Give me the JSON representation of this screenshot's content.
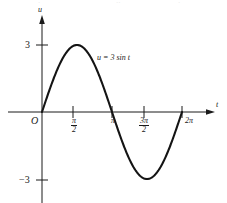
{
  "figure": {
    "background_color": "#ffffff",
    "ink_color": "#1a1a1a",
    "width": 227,
    "height": 203
  },
  "axes": {
    "u_axis_label": "u",
    "t_axis_label": "t",
    "origin_label": "O"
  },
  "ticks": {
    "y": [
      {
        "label": "3",
        "value": 3
      },
      {
        "label": "−3",
        "value": -3
      }
    ],
    "x": [
      {
        "label_num": "π",
        "label_den": "2",
        "kind": "fraction",
        "value": 1.5708
      },
      {
        "label": "π",
        "kind": "plain",
        "value": 3.1416
      },
      {
        "label_num": "3π",
        "label_den": "2",
        "kind": "fraction",
        "value": 4.7124
      },
      {
        "label": "2π",
        "kind": "plain",
        "value": 6.2832
      }
    ]
  },
  "curve": {
    "equation_label": "u = 3 sin t",
    "amplitude": 3,
    "color": "#141414"
  },
  "scan_artifact": {
    "fragments": [
      "·",
      "··",
      "·"
    ]
  },
  "chart_data": {
    "type": "line",
    "title": "",
    "subtitle": "",
    "xlabel": "t",
    "ylabel": "u",
    "grid": false,
    "legend": "none",
    "annotations": [
      {
        "text": "u = 3 sin t",
        "x": 2.6,
        "y": 1.95
      },
      {
        "text": "O",
        "x": 0,
        "y": 0
      }
    ],
    "xlim": [
      -0.55,
      7.35
    ],
    "ylim": [
      -4.35,
      4.6
    ],
    "xticks": [
      1.5708,
      3.1416,
      4.7124,
      6.2832
    ],
    "xticklabels": [
      "π/2",
      "π",
      "3π/2",
      "2π"
    ],
    "yticks": [
      3,
      -3
    ],
    "yticklabels": [
      "3",
      "−3"
    ],
    "series": [
      {
        "name": "u = 3 sin t",
        "formula": "u = 3*sin(t)",
        "x": [
          0,
          0.3142,
          0.6283,
          0.9425,
          1.2566,
          1.5708,
          1.885,
          2.1991,
          2.5133,
          2.8274,
          3.1416,
          3.4558,
          3.7699,
          4.0841,
          4.3982,
          4.7124,
          5.0265,
          5.3407,
          5.6549,
          5.969,
          6.2832
        ],
        "values": [
          0,
          0.927,
          1.763,
          2.427,
          2.853,
          3,
          2.853,
          2.427,
          1.763,
          0.927,
          0,
          -0.927,
          -1.763,
          -2.427,
          -2.853,
          -3,
          -2.853,
          -2.427,
          -1.763,
          -0.927,
          0
        ]
      }
    ]
  }
}
